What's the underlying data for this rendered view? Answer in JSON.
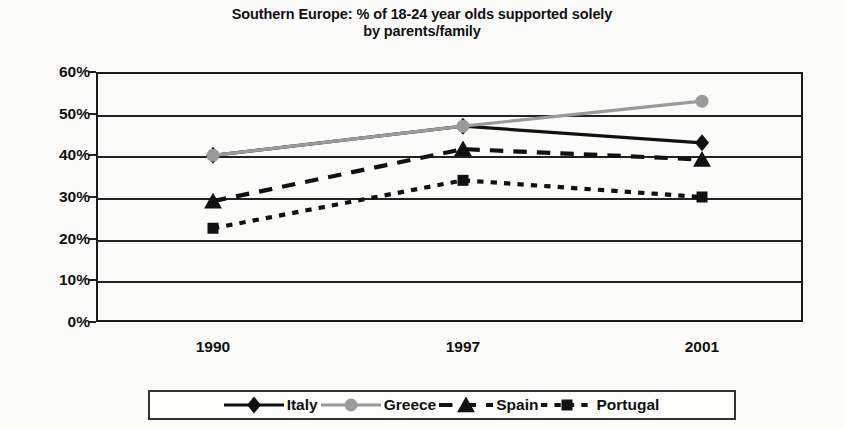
{
  "chart_data": {
    "type": "line",
    "title": "Southern Europe: % of 18-24 year olds supported solely by parents/family",
    "title_line1": "Southern Europe: % of 18-24 year olds supported solely",
    "title_line2": "by parents/family",
    "xlabel": "",
    "ylabel": "",
    "categories": [
      "1990",
      "1997",
      "2001"
    ],
    "x": [
      "1990",
      "1997",
      "2001"
    ],
    "ylim": [
      0,
      60
    ],
    "ytick_labels": [
      "0%",
      "10%",
      "20%",
      "30%",
      "40%",
      "50%",
      "60%"
    ],
    "ytick_values": [
      0,
      10,
      20,
      30,
      40,
      50,
      60
    ],
    "grid": true,
    "legend_position": "bottom",
    "series": [
      {
        "name": "Italy",
        "values": [
          40,
          47,
          43
        ],
        "color": "#111111",
        "marker": "diamond",
        "linestyle": "solid"
      },
      {
        "name": "Greece",
        "values": [
          40,
          47,
          53
        ],
        "color": "#9a9a9a",
        "marker": "circle",
        "linestyle": "solid"
      },
      {
        "name": "Spain",
        "values": [
          29,
          41.5,
          39
        ],
        "color": "#111111",
        "marker": "triangle",
        "linestyle": "dashed"
      },
      {
        "name": "Portugal",
        "values": [
          22.5,
          34,
          30
        ],
        "color": "#111111",
        "marker": "square",
        "linestyle": "dotted"
      }
    ]
  },
  "legend": {
    "items": [
      {
        "label": "Italy"
      },
      {
        "label": "Greece"
      },
      {
        "label": "Spain"
      },
      {
        "label": "Portugal"
      }
    ]
  }
}
